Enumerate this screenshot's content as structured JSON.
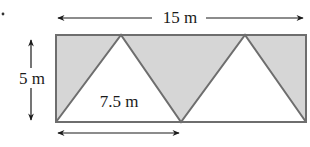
{
  "diagram": {
    "colors": {
      "shade": "#d6d6d6",
      "stroke": "#6e6e6e",
      "text": "#1a1a1a",
      "arrow": "#1a1a1a"
    },
    "labels": {
      "width": "15 m",
      "height": "5 m",
      "base": "7.5 m"
    },
    "dimensions": {
      "rectangle_width_m": 15,
      "rectangle_height_m": 5,
      "triangle_base_m": 7.5
    }
  }
}
